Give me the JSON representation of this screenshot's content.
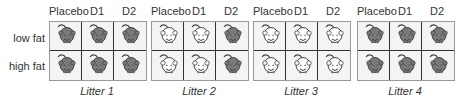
{
  "row_labels": [
    "low fat",
    "high fat"
  ],
  "column_labels": [
    "Placebo",
    "D1",
    "D2"
  ],
  "colors": {
    "dark_mouse": "#7a7a7a",
    "light_mouse": "#ffffff",
    "outline": "#444444"
  },
  "litters": [
    {
      "label": "Litter 1",
      "x": 49,
      "mice": [
        "dark",
        "dark",
        "dark",
        "dark",
        "dark",
        "dark"
      ]
    },
    {
      "label": "Litter 2",
      "x": 151,
      "mice": [
        "light",
        "light",
        "dark",
        "light",
        "light",
        "dark"
      ]
    },
    {
      "label": "Litter 3",
      "x": 253,
      "mice": [
        "light",
        "light",
        "light",
        "light",
        "light",
        "light"
      ]
    },
    {
      "label": "Litter 4",
      "x": 357,
      "mice": [
        "dark",
        "dark",
        "dark",
        "dark",
        "dark",
        "dark"
      ]
    }
  ]
}
